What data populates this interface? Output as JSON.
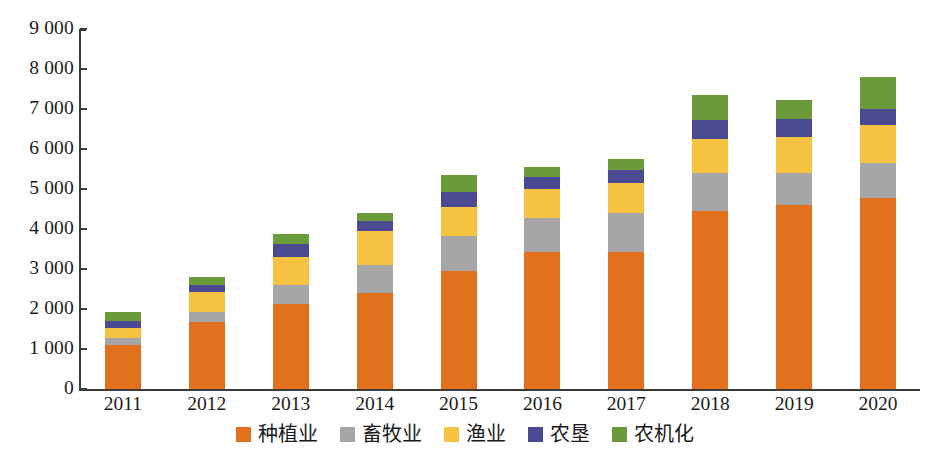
{
  "chart_data": {
    "type": "bar",
    "subtype": "stacked-bar",
    "title": "",
    "xlabel": "",
    "ylabel": "",
    "categories": [
      "2011",
      "2012",
      "2013",
      "2014",
      "2015",
      "2016",
      "2017",
      "2018",
      "2019",
      "2020"
    ],
    "ylim": [
      0,
      9000
    ],
    "ytick_values": [
      0,
      1000,
      2000,
      3000,
      4000,
      5000,
      6000,
      7000,
      8000,
      9000
    ],
    "ytick_labels": [
      "0",
      "1 000",
      "2 000",
      "3 000",
      "4 000",
      "5 000",
      "6 000",
      "7 000",
      "8 000",
      "9 000"
    ],
    "grid": false,
    "legend_position": "bottom",
    "series": [
      {
        "name": "种植业",
        "color": "#E2711D",
        "values": [
          1100,
          1680,
          2120,
          2400,
          2960,
          3420,
          3420,
          4440,
          4600,
          4780
        ]
      },
      {
        "name": "畜牧业",
        "color": "#A6A6A6",
        "values": [
          180,
          250,
          480,
          700,
          870,
          860,
          980,
          970,
          800,
          880
        ]
      },
      {
        "name": "渔业",
        "color": "#F5C242",
        "values": [
          250,
          490,
          690,
          850,
          710,
          730,
          750,
          830,
          900,
          950
        ]
      },
      {
        "name": "农垦",
        "color": "#4A4A93",
        "values": [
          170,
          180,
          330,
          250,
          390,
          280,
          330,
          490,
          440,
          380
        ]
      },
      {
        "name": "农机化",
        "color": "#6A9A3A",
        "values": [
          225,
          200,
          250,
          200,
          420,
          260,
          280,
          620,
          480,
          800
        ]
      }
    ],
    "totals": [
      1925,
      2800,
      3870,
      4400,
      5350,
      5550,
      5760,
      7350,
      7220,
      7790
    ]
  }
}
